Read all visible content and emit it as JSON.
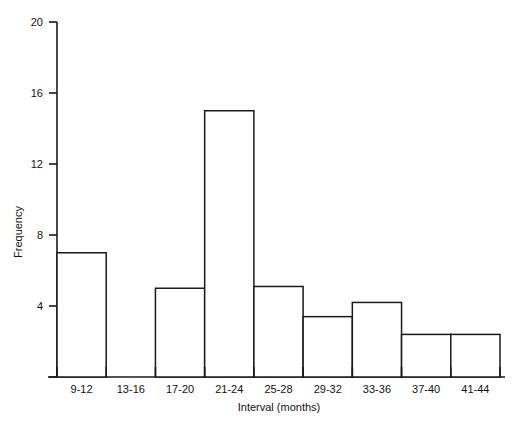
{
  "chart_data": {
    "type": "bar",
    "title": "",
    "subtitle": "",
    "xlabel": "Interval (months)",
    "ylabel": "Frequency",
    "categories": [
      "9-12",
      "13-16",
      "17-20",
      "21-24",
      "25-28",
      "29-32",
      "33-36",
      "37-40",
      "41-44"
    ],
    "values": [
      7,
      0,
      5,
      15,
      5.1,
      3.4,
      4.2,
      2.4,
      2.4
    ],
    "ylim": [
      0,
      20
    ],
    "ytick_labels": [
      "0",
      "4",
      "8",
      "12",
      "16",
      "20"
    ],
    "ytick_values": [
      0,
      4,
      8,
      12,
      16,
      20
    ],
    "grid": false,
    "legend": null,
    "bar_style": "outline",
    "bar_fill_color": "#ffffff",
    "bar_edge_color": "#1a1a1a",
    "axis_color": "#1a1a1a"
  },
  "axes": {
    "y_axis_name": "frequency-axis",
    "x_axis_name": "interval-axis"
  }
}
